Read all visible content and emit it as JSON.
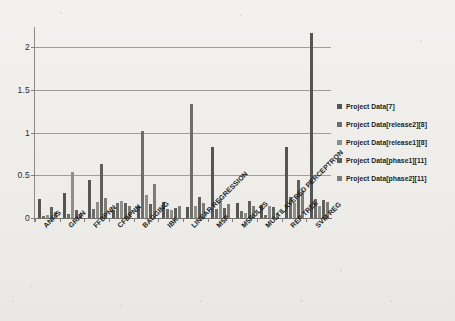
{
  "chart_data": {
    "type": "bar",
    "title": "",
    "subtitle": "",
    "xlabel": "",
    "ylabel": "",
    "ylim": [
      0,
      2.2
    ],
    "yticks": [
      "0",
      "0.5",
      "1",
      "1.5",
      "2"
    ],
    "ytick_values": [
      0,
      0.5,
      1,
      1.5,
      2
    ],
    "grid": true,
    "legend_position": "right",
    "categories": [
      "ANFIS",
      "GRNN",
      "FFBPNN",
      "CFBPNN",
      "BAGGING",
      "IBK",
      "LINEAR REGRESSION",
      "M5P",
      "M5RULES",
      "MULTILAYERED PERCEPTRON",
      "REP TREE",
      "SVM REG"
    ],
    "series": [
      {
        "name": "Project Data[7]",
        "color": "#555552",
        "values": [
          0.22,
          0.29,
          0.45,
          0.09,
          0.14,
          0.19,
          0.13,
          0.83,
          0.18,
          0.15,
          0.83,
          2.17
        ]
      },
      {
        "name": "Project Data[release2][8]",
        "color": "#6d6d69",
        "values": [
          0.02,
          0.05,
          0.11,
          0.17,
          1.02,
          0.1,
          1.33,
          0.1,
          0.08,
          0.03,
          0.25,
          0.22
        ]
      },
      {
        "name": "Project Data[release1][8]",
        "color": "#8e8e8a",
        "values": [
          0.04,
          0.54,
          0.19,
          0.2,
          0.27,
          0.09,
          0.14,
          0.22,
          0.06,
          0.14,
          0.17,
          0.14
        ]
      },
      {
        "name": "Project Data[phase1][11]",
        "color": "#5f5f5c",
        "values": [
          0.13,
          0.09,
          0.63,
          0.18,
          0.16,
          0.12,
          0.25,
          0.12,
          0.2,
          0.13,
          0.45,
          0.21
        ]
      },
      {
        "name": "Project Data[phase2][11]",
        "color": "#7c7c78",
        "values": [
          0.07,
          0.05,
          0.24,
          0.14,
          0.4,
          0.14,
          0.18,
          0.16,
          0.14,
          0.05,
          0.32,
          0.19
        ]
      }
    ]
  },
  "legend": {
    "items": [
      {
        "label": "Project Data[7]"
      },
      {
        "label": "Project Data[release2][8]"
      },
      {
        "label": "Project Data[release1][8]"
      },
      {
        "label": "Project Data[phase1][11]"
      },
      {
        "label": "Project Data[phase2][11]"
      }
    ]
  }
}
